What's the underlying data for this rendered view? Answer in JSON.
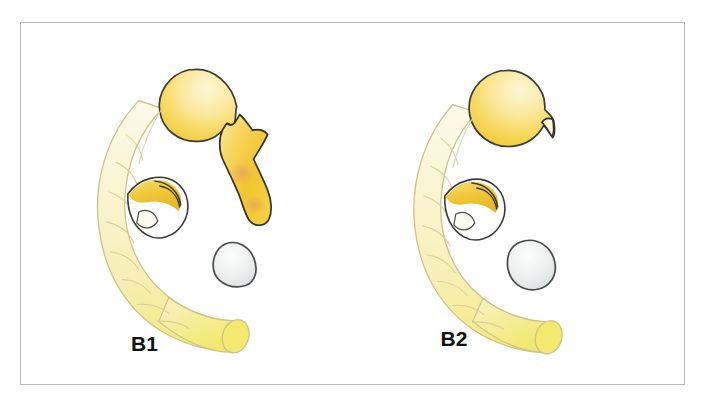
{
  "figure": {
    "background_color": "#ffffff",
    "frame_border_color": "#b9b9bd",
    "panel_count": 2
  },
  "panels": [
    {
      "id": "B1",
      "label": "B1",
      "label_color": "#111113",
      "description": "Duodenum with contrast-filled bulb and extravasation tract",
      "has_leak": true,
      "structures": [
        {
          "name": "duodenum",
          "color": "#faf4cf",
          "outline": "#cbc38a"
        },
        {
          "name": "duodenal-bulb",
          "color": "#f6d34a",
          "outline": "#3a3a3a"
        },
        {
          "name": "extravasation-tract",
          "color": "#f7cc3d",
          "outline": "#33312c"
        },
        {
          "name": "cystic-duct-stump",
          "color": "#f0c93c",
          "outline": "#2f2f2f"
        },
        {
          "name": "gallstone",
          "color": "#e9ebeb",
          "outline": "#4a4a4a"
        }
      ]
    },
    {
      "id": "B2",
      "label": "B2",
      "label_color": "#111113",
      "description": "Duodenum with contrast-filled bulb and small beaked outpouching, no leak",
      "has_leak": false,
      "structures": [
        {
          "name": "duodenum",
          "color": "#faf4cf",
          "outline": "#cbc38a"
        },
        {
          "name": "duodenal-bulb",
          "color": "#f6d34a",
          "outline": "#3a3a3a"
        },
        {
          "name": "bulb-beak",
          "color": "#fdf6d8",
          "outline": "#33312c"
        },
        {
          "name": "cystic-duct-stump",
          "color": "#f0c93c",
          "outline": "#2f2f2f"
        },
        {
          "name": "gallstone",
          "color": "#e9ebeb",
          "outline": "#4a4a4a"
        }
      ]
    }
  ],
  "colors": {
    "duodenum_pale": "#faf4cf",
    "duodenum_saturated": "#f4ec78",
    "contrast_yellow": "#f6d34a",
    "contrast_deep": "#eebb22",
    "stone_grey": "#e9ebeb",
    "outline_dark": "#3a3a3a",
    "outline_light": "#cbc38a",
    "leak_blush": "#e8a98a",
    "frame": "#b9b9bd",
    "label_black": "#111113"
  }
}
